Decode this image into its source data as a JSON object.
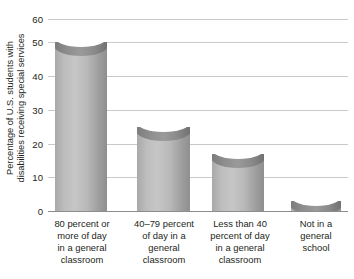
{
  "chart_data": {
    "type": "bar",
    "title": "",
    "xlabel": "",
    "ylabel_lines": [
      "Percentage of U.S. students with",
      "disabilities receiving special services"
    ],
    "ylabel": "Percentage of U.S. students with disabilities receiving special services",
    "ylim": [
      0,
      60
    ],
    "yticks": [
      0,
      10,
      20,
      30,
      40,
      50,
      60
    ],
    "ytick_labels": [
      "0",
      "10",
      "20",
      "30",
      "40",
      "50",
      "60"
    ],
    "grid": true,
    "legend": "none",
    "categories": [
      "80 percent or more of day in a general classroom",
      "40–79 percent of day in a general classroom",
      "Less than 40 percent of day in a general classroom",
      "Not in a general school"
    ],
    "category_lines": [
      [
        "80 percent or",
        "more of day",
        "in a general",
        "classroom"
      ],
      [
        "40–79 percent",
        "of day in a",
        "general",
        "classroom"
      ],
      [
        "Less than 40",
        "percent of day",
        "in a general",
        "classroom"
      ],
      [
        "Not in a",
        "general",
        "school"
      ]
    ],
    "values": [
      50,
      25,
      17,
      3
    ],
    "bar_color": "#b4b4b4",
    "bar_color_dark": "#8a8a8a",
    "gridline_color": "#c9c9c9",
    "axis_color": "#8d8d8d",
    "text_color": "#231f20"
  }
}
